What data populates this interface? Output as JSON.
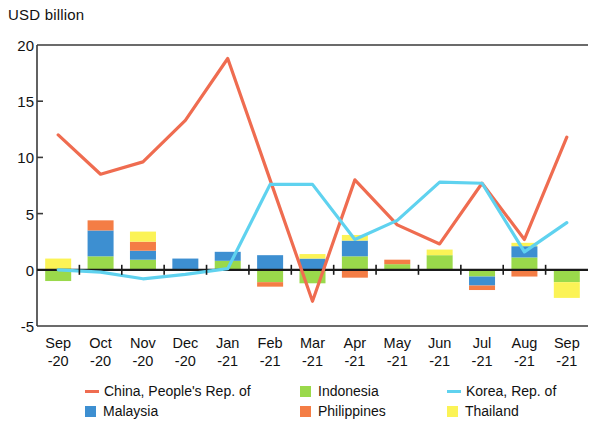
{
  "chart_data": {
    "type": "bar",
    "title": "USD billion",
    "ylabel": "USD billion",
    "xlabel": "",
    "ylim": [
      -5,
      20
    ],
    "yticks": [
      20,
      15,
      10,
      5,
      0,
      -5
    ],
    "grid": false,
    "legend_position": "bottom",
    "stacked": true,
    "categories": [
      "Sep -20",
      "Oct -20",
      "Nov -20",
      "Dec -20",
      "Jan -21",
      "Feb -21",
      "Mar -21",
      "Apr -21",
      "May -21",
      "Jun -21",
      "Jul -21",
      "Aug -21",
      "Sep -21"
    ],
    "category_lines": [
      [
        "Sep",
        "-20"
      ],
      [
        "Oct",
        "-20"
      ],
      [
        "Nov",
        "-20"
      ],
      [
        "Dec",
        "-20"
      ],
      [
        "Jan",
        "-21"
      ],
      [
        "Feb",
        "-21"
      ],
      [
        "Mar",
        "-21"
      ],
      [
        "Apr",
        "-21"
      ],
      [
        "May",
        "-21"
      ],
      [
        "Jun",
        "-21"
      ],
      [
        "Jul",
        "-21"
      ],
      [
        "Aug",
        "-21"
      ],
      [
        "Sep",
        "-21"
      ]
    ],
    "bar_series": [
      {
        "name": "Indonesia",
        "color": "#9ad94b",
        "values": [
          -1.0,
          1.2,
          0.9,
          0.0,
          0.8,
          -1.1,
          -1.2,
          1.2,
          0.5,
          1.3,
          -0.6,
          1.1,
          -1.1
        ]
      },
      {
        "name": "Malaysia",
        "color": "#3d8fd1",
        "values": [
          0.0,
          2.3,
          0.8,
          1.0,
          0.8,
          1.3,
          1.0,
          1.4,
          0.0,
          0.0,
          -0.8,
          1.0,
          0.0
        ]
      },
      {
        "name": "Philippines",
        "color": "#f47d45",
        "values": [
          0.0,
          0.9,
          0.8,
          0.0,
          0.0,
          -0.4,
          0.0,
          -0.7,
          0.4,
          0.0,
          -0.4,
          -0.6,
          0.0
        ]
      },
      {
        "name": "Thailand",
        "color": "#fbf356",
        "values": [
          1.0,
          0.0,
          0.9,
          0.0,
          0.0,
          0.0,
          0.4,
          0.5,
          0.0,
          0.5,
          0.0,
          0.3,
          -1.4
        ]
      }
    ],
    "line_series": [
      {
        "name": "China, People's Rep. of",
        "color": "#ef6c50",
        "values": [
          12.0,
          8.5,
          9.6,
          13.3,
          18.8,
          8.0,
          -2.8,
          8.0,
          4.0,
          2.3,
          7.7,
          2.7,
          11.8
        ]
      },
      {
        "name": "Korea, Rep. of",
        "color": "#5fd2ef",
        "values": [
          0.0,
          -0.2,
          -0.8,
          -0.4,
          0.1,
          7.6,
          7.6,
          2.7,
          4.4,
          7.8,
          7.7,
          1.6,
          4.2
        ]
      }
    ]
  },
  "legend": {
    "items": [
      {
        "label": "China, People's Rep. of",
        "color": "#ef6c50",
        "marker": "line"
      },
      {
        "label": "Indonesia",
        "color": "#9ad94b",
        "marker": "box"
      },
      {
        "label": "Korea, Rep. of",
        "color": "#5fd2ef",
        "marker": "line"
      },
      {
        "label": "Malaysia",
        "color": "#3d8fd1",
        "marker": "box"
      },
      {
        "label": "Philippines",
        "color": "#f47d45",
        "marker": "box"
      },
      {
        "label": "Thailand",
        "color": "#fbf356",
        "marker": "box"
      }
    ]
  },
  "axes": {
    "frame_color": "#3a3a3a",
    "zero_line_color": "#1a1a1a"
  }
}
